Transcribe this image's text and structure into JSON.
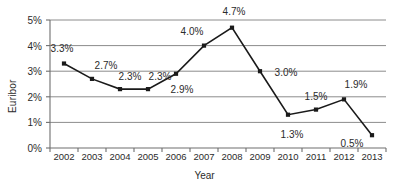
{
  "chart_data": {
    "type": "line",
    "title": "",
    "xlabel": "Year",
    "ylabel": "Euribor",
    "categories": [
      "2002",
      "2003",
      "2004",
      "2005",
      "2006",
      "2007",
      "2008",
      "2009",
      "2010",
      "2011",
      "2012",
      "2013"
    ],
    "values": [
      3.3,
      2.7,
      2.3,
      2.3,
      2.9,
      4.0,
      4.7,
      3.0,
      1.3,
      1.5,
      1.9,
      0.5
    ],
    "point_labels": [
      "3.3%",
      "2.7%",
      "2.3%",
      "2.3%",
      "2.9%",
      "4.0%",
      "4.7%",
      "3.0%",
      "1.3%",
      "1.5%",
      "1.9%",
      "0.5%"
    ],
    "ylim": [
      0,
      5
    ],
    "ytick_values": [
      0,
      1,
      2,
      3,
      4,
      5
    ],
    "ytick_labels": [
      "0%",
      "1%",
      "2%",
      "3%",
      "4%",
      "5%"
    ],
    "grid": true,
    "grid_axis": "y",
    "legend": false,
    "series_color": "#1a1a1a",
    "marker": "square",
    "marker_color": "#1a1a1a",
    "grid_color": "#8c8c8c",
    "axis_color": "#6e6e6e",
    "label_color": "#2b2b2b"
  },
  "axis": {
    "y_title": "Euribor",
    "x_title": "Year"
  }
}
